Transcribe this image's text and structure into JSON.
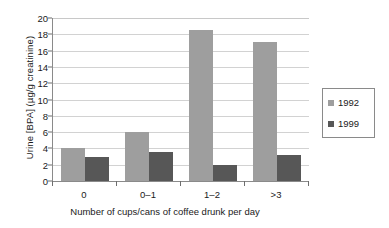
{
  "chart_data": {
    "type": "bar",
    "title": "",
    "xlabel": "Number of cups/cans of coffee drunk per day",
    "ylabel": "Urine [BPA] (µg/g creatinine)",
    "categories": [
      "0",
      "0–1",
      "1–2",
      ">3"
    ],
    "series": [
      {
        "name": "1992",
        "values": [
          4.0,
          6.0,
          18.5,
          17.0
        ],
        "color": "#9e9e9e"
      },
      {
        "name": "1999",
        "values": [
          3.0,
          3.5,
          2.0,
          3.2
        ],
        "color": "#575757"
      }
    ],
    "ylim": [
      0,
      20
    ],
    "ytick_values": [
      0,
      2,
      4,
      6,
      8,
      10,
      12,
      14,
      16,
      18,
      20
    ],
    "ytick_labels": [
      "0",
      "2",
      "4",
      "6",
      "8",
      "10",
      "12",
      "14",
      "16",
      "18",
      "20"
    ],
    "grid": "horizontal",
    "legend_position": "right",
    "legend_entries": [
      "1992",
      "1999"
    ]
  }
}
